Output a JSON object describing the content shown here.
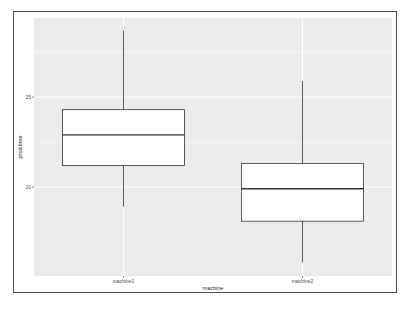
{
  "chart_data": {
    "type": "box",
    "title": "",
    "xlabel": "machine",
    "ylabel": "prod.time",
    "categories": [
      "machine1",
      "machine2"
    ],
    "series": [
      {
        "name": "machine1",
        "whisker_low": 18.9,
        "q1": 21.2,
        "median": 22.9,
        "q3": 24.3,
        "whisker_high": 28.7
      },
      {
        "name": "machine2",
        "whisker_low": 15.8,
        "q1": 18.1,
        "median": 19.9,
        "q3": 21.3,
        "whisker_high": 25.9
      }
    ],
    "yticks": [
      20,
      25
    ],
    "ylim": [
      15.05,
      29.4
    ],
    "grid": true,
    "legend": "none",
    "colors": {
      "panel": "#ebebeb",
      "grid": "#ffffff",
      "box_fill": "#ffffff",
      "box_line": "#333333"
    }
  },
  "axes": {
    "x": {
      "title": "machine",
      "ticks": [
        "machine1",
        "machine2"
      ]
    },
    "y": {
      "title": "prod.time",
      "ticks": [
        "20",
        "25"
      ]
    }
  }
}
